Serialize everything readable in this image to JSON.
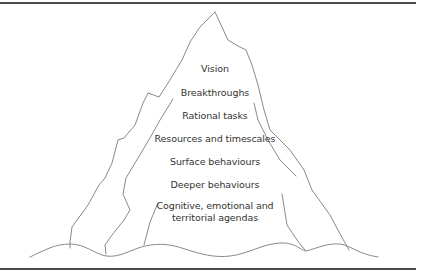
{
  "diagram": {
    "type": "iceberg",
    "layers": [
      {
        "label": "Vision"
      },
      {
        "label": "Breakthroughs"
      },
      {
        "label": "Rational tasks"
      },
      {
        "label": "Resources and timescales"
      },
      {
        "label": "Surface behaviours"
      },
      {
        "label": "Deeper behaviours"
      },
      {
        "label_line1": "Cognitive, emotional and",
        "label_line2": "territorial agendas"
      }
    ],
    "colors": {
      "outline": "#8a8a8a",
      "rule": "#4a4a4a",
      "text": "#333333",
      "background": "#ffffff"
    }
  }
}
